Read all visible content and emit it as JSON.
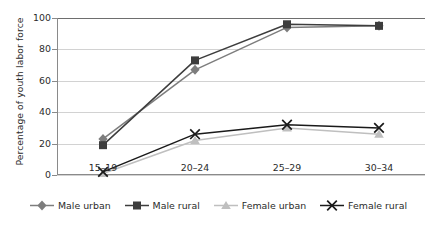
{
  "chart_data": {
    "type": "line",
    "title": "",
    "xlabel": "",
    "ylabel": "Percentage of youth labor force",
    "categories": [
      "15–19",
      "20–24",
      "25–29",
      "30–34"
    ],
    "ylim": [
      0,
      100
    ],
    "yticks": [
      0,
      20,
      40,
      60,
      80,
      100
    ],
    "ytick_labels": [
      "0",
      "20",
      "40",
      "60",
      "80",
      "100"
    ],
    "grid": true,
    "legend_position": "bottom",
    "series": [
      {
        "name": "Male urban",
        "marker": "diamond",
        "color": "#7d7d7d",
        "values": [
          23,
          67,
          94,
          95
        ]
      },
      {
        "name": "Male rural",
        "marker": "square",
        "color": "#3d3d3d",
        "values": [
          19,
          73,
          96,
          95
        ]
      },
      {
        "name": "Female urban",
        "marker": "triangle",
        "color": "#bfbfbf",
        "values": [
          1,
          22,
          30,
          26
        ]
      },
      {
        "name": "Female rural",
        "marker": "x",
        "color": "#1a1a1a",
        "values": [
          2,
          26,
          32,
          30
        ]
      }
    ]
  },
  "colors": {
    "male_urban": "#7d7d7d",
    "male_rural": "#3d3d3d",
    "female_urban": "#bfbfbf",
    "female_rural": "#1a1a1a",
    "gridline": "#d2d2d2",
    "axis": "#8a8a8a",
    "text": "#2b2b2b",
    "background": "#ffffff"
  },
  "legend": {
    "items": [
      {
        "label": "Male urban",
        "marker": "diamond-marker-icon"
      },
      {
        "label": "Male rural",
        "marker": "square-marker-icon"
      },
      {
        "label": "Female urban",
        "marker": "triangle-marker-icon"
      },
      {
        "label": "Female rural",
        "marker": "x-marker-icon"
      }
    ]
  }
}
